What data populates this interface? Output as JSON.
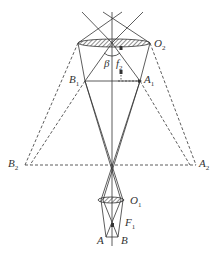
{
  "diagram": {
    "type": "optics-ray-diagram",
    "labels": {
      "O2": {
        "main": "O",
        "sub": "2"
      },
      "O1": {
        "main": "O",
        "sub": "1"
      },
      "beta": {
        "main": "β"
      },
      "f2": {
        "main": "f",
        "sub": "2"
      },
      "F1": {
        "main": "F",
        "sub": "1"
      },
      "A": {
        "main": "A"
      },
      "B": {
        "main": "B"
      },
      "A1": {
        "main": "A",
        "sub": "1"
      },
      "B1": {
        "main": "B",
        "sub": "1"
      },
      "A2": {
        "main": "A",
        "sub": "2"
      },
      "B2": {
        "main": "B",
        "sub": "2"
      }
    },
    "colors": {
      "line": "#333333",
      "hatch": "#444444",
      "background": "#ffffff"
    }
  }
}
